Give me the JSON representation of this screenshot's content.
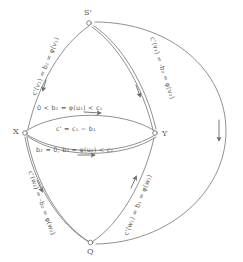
{
  "diagram": {
    "ink_color": "#6b6b6b",
    "label_color": "#5c5c5c",
    "background": "#ffffff",
    "nodes": [
      {
        "id": "S",
        "label": "S'",
        "x": 88,
        "y": 23
      },
      {
        "id": "X",
        "label": "X",
        "x": 23,
        "y": 132
      },
      {
        "id": "Y",
        "label": "Y",
        "x": 156,
        "y": 134
      },
      {
        "id": "Q",
        "label": "Q",
        "x": 90,
        "y": 243
      }
    ],
    "edge_labels": [
      {
        "id": "edge-label-s-x",
        "text": "c'(v₁) = b₁ = φ(v₁)",
        "x": 34,
        "y": 92,
        "rotate": -68
      },
      {
        "id": "edge-label-s-y",
        "text": "c'(v₂) = -b₂ = φ(v₂)",
        "x": 152,
        "y": 34,
        "rotate": 72
      },
      {
        "id": "edge-label-x-y-top",
        "text": "0 < b₁ = φ(u₁) < c₁",
        "x": 37,
        "y": 105,
        "rotate": 0
      },
      {
        "id": "edge-label-x-y-capacity",
        "text": "c' = c₁ − b₁",
        "x": 56,
        "y": 126,
        "rotate": 0
      },
      {
        "id": "edge-label-x-y-bottom",
        "text": "b₂ = 0, b₂ = φ(u₂) < c₂",
        "x": 36,
        "y": 147,
        "rotate": 0
      },
      {
        "id": "edge-label-x-q",
        "text": "c'(w₂) = -b₂ = φ(w₂)",
        "x": 30,
        "y": 168,
        "rotate": 70
      },
      {
        "id": "edge-label-y-q",
        "text": "c'(w₁) = b₁ = φ(w₁)",
        "x": 126,
        "y": 232,
        "rotate": -68
      }
    ],
    "outer_arc": {
      "id": "outer-return-arc",
      "description": "large arc from S' around the right side down to Q",
      "arrow_direction": "down",
      "arrow_x": 218,
      "arrow_y": 136
    }
  }
}
